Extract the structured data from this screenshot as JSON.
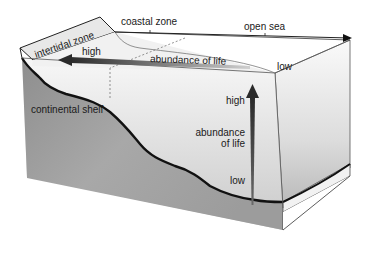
{
  "diagram": {
    "zones": {
      "intertidal": "intertidal zone",
      "coastal": "coastal zone",
      "open_sea": "open sea"
    },
    "horizontal_gradient": {
      "high": "high",
      "label": "abundance of life",
      "low": "low"
    },
    "vertical_gradient": {
      "high": "high",
      "label_line1": "abundance",
      "label_line2": "of life",
      "low": "low"
    },
    "seafloor": {
      "continental_shelf": "continental shelf"
    },
    "colors": {
      "seabed_fill": "#9a9a9a",
      "water_front": "#d6d6d6",
      "water_side": "#e6e6e6",
      "top_surface": "#efefef",
      "outline": "#222222",
      "arrow": "#3a3a3a"
    }
  }
}
